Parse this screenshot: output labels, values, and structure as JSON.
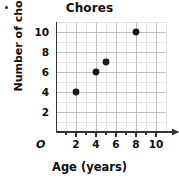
{
  "chart_data": {
    "type": "scatter",
    "title": "Chores",
    "xlabel": "Age (years)",
    "ylabel": "Number of chores",
    "origin_label": "O",
    "xlim": [
      0,
      11
    ],
    "ylim": [
      0,
      11
    ],
    "grid": true,
    "grid_step": 1,
    "legend": null,
    "x_ticks": [
      2,
      4,
      6,
      8,
      10
    ],
    "y_ticks": [
      2,
      4,
      6,
      8,
      10
    ],
    "x_tick_labels": [
      "2",
      "4",
      "6",
      "8",
      "10"
    ],
    "y_tick_labels": [
      "2",
      "4",
      "6",
      "8",
      "10"
    ],
    "points": [
      {
        "x": 2,
        "y": 4
      },
      {
        "x": 4,
        "y": 6
      },
      {
        "x": 5,
        "y": 7
      },
      {
        "x": 8,
        "y": 10
      }
    ],
    "marker": {
      "color": "#1a1a1a",
      "radius": 3.4
    },
    "colors": {
      "grid_minor": "#d9d9dd",
      "grid_major": "#b9b9c0",
      "axis": "#333333",
      "text": "#0d0d0d",
      "background": "#ffffff"
    }
  }
}
